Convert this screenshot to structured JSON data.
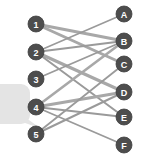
{
  "figure": {
    "name": "bipartite-matching-diagram",
    "width": 141,
    "height": 166,
    "background_color": "#ffffff"
  },
  "style": {
    "node_fill": "#4d4d4d",
    "node_stroke": "#3f3f3f",
    "node_label_color": "#ffffff",
    "node_radius": 8,
    "edge_color": "#9a9a9a",
    "edge_color_thick": "#a8a8a8",
    "callout_fill": "#e4e4e4",
    "node_label_font_size": 9
  },
  "callout": {
    "name": "speech-bubble-fragment",
    "visible": true,
    "x": -26,
    "y": 84,
    "width": 56,
    "height": 40,
    "radius": 9,
    "tail_points": "18,112 40,128 16,120"
  },
  "graph": {
    "type": "bipartite",
    "left_column": {
      "label": "numbered-set",
      "x": 36,
      "nodes": [
        {
          "id": "1",
          "label": "1",
          "x": 36,
          "y": 24
        },
        {
          "id": "2",
          "label": "2",
          "x": 36,
          "y": 52
        },
        {
          "id": "3",
          "label": "3",
          "x": 36,
          "y": 79
        },
        {
          "id": "4",
          "label": "4",
          "x": 36,
          "y": 107
        },
        {
          "id": "5",
          "label": "5",
          "x": 36,
          "y": 134
        }
      ]
    },
    "right_column": {
      "label": "lettered-set",
      "x": 124,
      "nodes": [
        {
          "id": "A",
          "label": "A",
          "x": 124,
          "y": 14
        },
        {
          "id": "B",
          "label": "B",
          "x": 124,
          "y": 41
        },
        {
          "id": "C",
          "label": "C",
          "x": 124,
          "y": 64
        },
        {
          "id": "D",
          "label": "D",
          "x": 124,
          "y": 92
        },
        {
          "id": "E",
          "label": "E",
          "x": 124,
          "y": 117
        },
        {
          "id": "F",
          "label": "F",
          "x": 124,
          "y": 145
        }
      ]
    },
    "edges": [
      {
        "from": "1",
        "to": "B",
        "width": 3.2
      },
      {
        "from": "1",
        "to": "C",
        "width": 3.0
      },
      {
        "from": "2",
        "to": "A",
        "width": 1.6
      },
      {
        "from": "2",
        "to": "B",
        "width": 2.2
      },
      {
        "from": "2",
        "to": "D",
        "width": 3.2
      },
      {
        "from": "2",
        "to": "E",
        "width": 2.0
      },
      {
        "from": "3",
        "to": "B",
        "width": 1.8
      },
      {
        "from": "4",
        "to": "B",
        "width": 2.6
      },
      {
        "from": "4",
        "to": "D",
        "width": 3.2
      },
      {
        "from": "4",
        "to": "E",
        "width": 2.0
      },
      {
        "from": "4",
        "to": "F",
        "width": 1.8
      },
      {
        "from": "5",
        "to": "C",
        "width": 1.8
      },
      {
        "from": "5",
        "to": "D",
        "width": 2.0
      }
    ]
  }
}
